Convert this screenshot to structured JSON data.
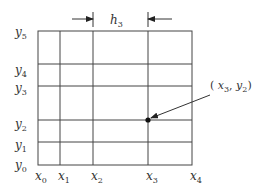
{
  "diagram": {
    "type": "rectangular grid (finite difference mesh)",
    "x_labels": [
      {
        "base": "x",
        "sub": "0"
      },
      {
        "base": "x",
        "sub": "1"
      },
      {
        "base": "x",
        "sub": "2"
      },
      {
        "base": "x",
        "sub": "3"
      },
      {
        "base": "x",
        "sub": "4"
      }
    ],
    "y_labels": [
      {
        "base": "y",
        "sub": "0"
      },
      {
        "base": "y",
        "sub": "1"
      },
      {
        "base": "y",
        "sub": "2"
      },
      {
        "base": "y",
        "sub": "3"
      },
      {
        "base": "y",
        "sub": "4"
      },
      {
        "base": "y",
        "sub": "5"
      }
    ],
    "spacing_label": {
      "base": "h",
      "sub": "3"
    },
    "point_label": {
      "open": "( ",
      "x": "x",
      "xsub": "3",
      "sep": ", ",
      "y": "y",
      "ysub": "2",
      "close": ")"
    },
    "line_color": "#333333"
  }
}
